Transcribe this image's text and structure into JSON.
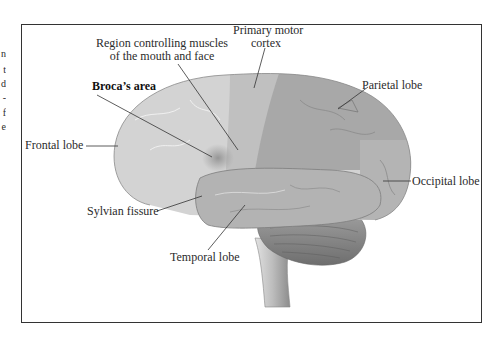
{
  "figure": {
    "left_margin_fragments": [
      "n",
      "t",
      "d",
      "-",
      "f",
      "e"
    ],
    "labels": {
      "primary_motor_cortex": {
        "line1": "Primary motor",
        "line2": "cortex"
      },
      "region_mouth_face": {
        "line1": "Region controlling muscles",
        "line2": "of the mouth and face"
      },
      "brocas_area": "Broca’s area",
      "frontal_lobe": "Frontal lobe",
      "parietal_lobe": "Parietal lobe",
      "occipital_lobe": "Occipital lobe",
      "sylvian_fissure": "Sylvian fissure",
      "temporal_lobe": "Temporal lobe"
    },
    "colors": {
      "frontal": "#d2d2d2",
      "motor_strip": "#bdbdbd",
      "parietal": "#a9a9a9",
      "occipital": "#b5b5b5",
      "temporal": "#b2b2b2",
      "cerebellum": "#8a8a8a",
      "brainstem": "#cfcfcf",
      "broca_spot": "#9a9a9a",
      "frame": "#333333",
      "leader_line": "#333333"
    }
  }
}
